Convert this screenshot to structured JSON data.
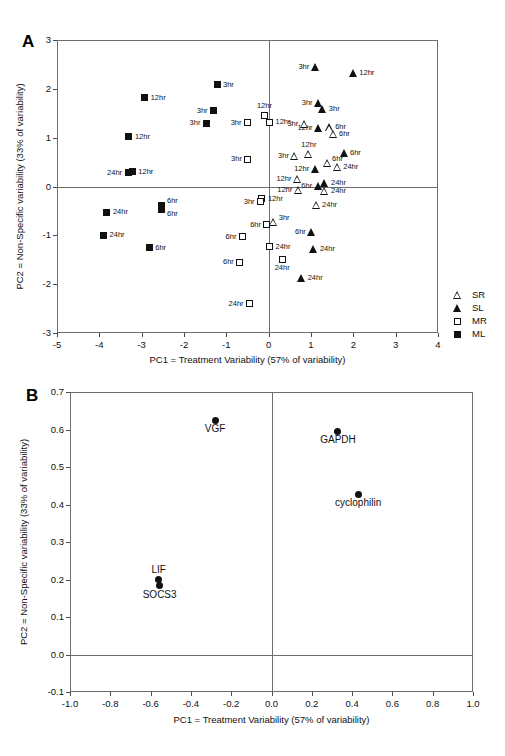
{
  "figure": {
    "panel_a_letter": "A",
    "panel_b_letter": "B"
  },
  "chart_data": [
    {
      "id": "panel_a",
      "type": "scatter",
      "title": "A",
      "xlabel": "PC1 = Treatment Variability (57% of variability)",
      "ylabel": "PC2 = Non-Specific variability (33% of variability)",
      "xlim": [
        -5,
        4
      ],
      "ylim": [
        -3,
        3
      ],
      "xticks": [
        "-5",
        "-4",
        "-3",
        "-2",
        "-1",
        "0",
        "1",
        "2",
        "3",
        "4"
      ],
      "yticks": [
        "3",
        "2",
        "1",
        "0",
        "-1",
        "-2",
        "-3"
      ],
      "grid": false,
      "zero_lines": true,
      "legend_position": "outside-bottom-right",
      "legend": [
        {
          "label": "SR",
          "marker": "open-triangle"
        },
        {
          "label": "SL",
          "marker": "filled-triangle"
        },
        {
          "label": "MR",
          "marker": "open-square"
        },
        {
          "label": "ML",
          "marker": "filled-square"
        }
      ],
      "series": [
        {
          "name": "ML",
          "marker": "filled-square",
          "points": [
            {
              "x": -1.22,
              "y": 2.08,
              "label": "3hr",
              "pos": "right"
            },
            {
              "x": -2.93,
              "y": 1.82,
              "label": "12hr",
              "pos": "right"
            },
            {
              "x": -1.3,
              "y": 1.55,
              "label": "3hr",
              "pos": "left"
            },
            {
              "x": -1.47,
              "y": 1.3,
              "label": "3hr",
              "pos": "left"
            },
            {
              "x": -3.3,
              "y": 1.02,
              "label": "12hr",
              "pos": "right"
            },
            {
              "x": -3.32,
              "y": 0.28,
              "label": "24hr",
              "pos": "left"
            },
            {
              "x": -3.22,
              "y": 0.3,
              "label": "12hr",
              "pos": "right"
            },
            {
              "x": -2.52,
              "y": -0.38,
              "label": "6hr",
              "pos": "above-right"
            },
            {
              "x": -2.52,
              "y": -0.47,
              "label": "6hr",
              "pos": "below-right"
            },
            {
              "x": -3.82,
              "y": -0.53,
              "label": "24hr",
              "pos": "right"
            },
            {
              "x": -3.9,
              "y": -1.0,
              "label": "24hr",
              "pos": "right"
            },
            {
              "x": -2.82,
              "y": -1.25,
              "label": "6hr",
              "pos": "right"
            }
          ]
        },
        {
          "name": "MR",
          "marker": "open-square",
          "points": [
            {
              "x": -0.1,
              "y": 1.46,
              "label": "12hr",
              "pos": "above"
            },
            {
              "x": -0.5,
              "y": 1.31,
              "label": "3hr",
              "pos": "left"
            },
            {
              "x": 0.02,
              "y": 1.32,
              "label": "12hr",
              "pos": "right"
            },
            {
              "x": -0.49,
              "y": 0.56,
              "label": "3hr",
              "pos": "left"
            },
            {
              "x": -0.16,
              "y": -0.25,
              "label": "12hr",
              "pos": "right"
            },
            {
              "x": -0.19,
              "y": -0.31,
              "label": "3hr",
              "pos": "left"
            },
            {
              "x": -0.04,
              "y": -0.78,
              "label": "6hr",
              "pos": "left"
            },
            {
              "x": -0.62,
              "y": -1.03,
              "label": "6hr",
              "pos": "left"
            },
            {
              "x": 0.02,
              "y": -1.23,
              "label": "24hr",
              "pos": "right"
            },
            {
              "x": -0.68,
              "y": -1.55,
              "label": "6hr",
              "pos": "left"
            },
            {
              "x": 0.32,
              "y": -1.49,
              "label": "24hr",
              "pos": "below"
            },
            {
              "x": -0.45,
              "y": -2.4,
              "label": "24hr",
              "pos": "left"
            }
          ]
        },
        {
          "name": "SL",
          "marker": "filled-triangle",
          "points": [
            {
              "x": 1.1,
              "y": 2.44,
              "label": "3hr",
              "pos": "left"
            },
            {
              "x": 2.0,
              "y": 2.33,
              "label": "12hr",
              "pos": "right"
            },
            {
              "x": 1.18,
              "y": 1.7,
              "label": "3hr",
              "pos": "left"
            },
            {
              "x": 1.28,
              "y": 1.58,
              "label": "3hr",
              "pos": "right"
            },
            {
              "x": 1.18,
              "y": 1.19,
              "label": "12hr",
              "pos": "left"
            },
            {
              "x": 1.78,
              "y": 0.68,
              "label": "6hr",
              "pos": "right"
            },
            {
              "x": 1.1,
              "y": 0.36,
              "label": "12hr",
              "pos": "left"
            },
            {
              "x": 1.33,
              "y": 0.07,
              "label": "24hr",
              "pos": "right"
            },
            {
              "x": 1.17,
              "y": 0.01,
              "label": "6hr",
              "pos": "left"
            },
            {
              "x": 1.02,
              "y": -0.94,
              "label": "6hr",
              "pos": "left"
            },
            {
              "x": 1.07,
              "y": -1.28,
              "label": "24hr",
              "pos": "right"
            },
            {
              "x": 0.78,
              "y": -1.88,
              "label": "24hr",
              "pos": "right"
            }
          ]
        },
        {
          "name": "SR",
          "marker": "open-triangle",
          "points": [
            {
              "x": 0.84,
              "y": 1.29,
              "label": "3hr",
              "pos": "left"
            },
            {
              "x": 1.43,
              "y": 1.21,
              "label": "6hr",
              "pos": "right"
            },
            {
              "x": 1.52,
              "y": 1.07,
              "label": "6hr",
              "pos": "right"
            },
            {
              "x": 0.62,
              "y": 0.63,
              "label": "3hr",
              "pos": "left"
            },
            {
              "x": 0.95,
              "y": 0.66,
              "label": "12hr",
              "pos": "above"
            },
            {
              "x": 1.38,
              "y": 0.48,
              "label": "6hr",
              "pos": "above-right"
            },
            {
              "x": 1.62,
              "y": 0.4,
              "label": "24hr",
              "pos": "right"
            },
            {
              "x": 0.68,
              "y": 0.16,
              "label": "12hr",
              "pos": "left"
            },
            {
              "x": 0.7,
              "y": -0.07,
              "label": "12hr",
              "pos": "left"
            },
            {
              "x": 1.33,
              "y": -0.09,
              "label": "24hr",
              "pos": "right"
            },
            {
              "x": 1.12,
              "y": -0.37,
              "label": "24hr",
              "pos": "right"
            },
            {
              "x": 0.12,
              "y": -0.72,
              "label": "3hr",
              "pos": "above-right"
            }
          ]
        }
      ]
    },
    {
      "id": "panel_b",
      "type": "scatter",
      "title": "B",
      "xlabel": "PC1 = Treatment Variability (57% of variability)",
      "ylabel": "PC2 = Non-Specific variability (33% of variability)",
      "xlim": [
        -1.0,
        1.0
      ],
      "ylim": [
        -0.1,
        0.7
      ],
      "xticks": [
        "-1.0",
        "-0.8",
        "-0.6",
        "-0.4",
        "-0.2",
        "0.0",
        "0.2",
        "0.4",
        "0.6",
        "0.8",
        "1.0"
      ],
      "yticks": [
        "0.7",
        "0.6",
        "0.5",
        "0.4",
        "0.3",
        "0.2",
        "0.1",
        "0.0",
        "-0.1"
      ],
      "grid": false,
      "zero_lines": true,
      "series": [
        {
          "name": "genes",
          "marker": "filled-circle",
          "points": [
            {
              "x": -0.28,
              "y": 0.625,
              "label": "VGF",
              "pos": "below"
            },
            {
              "x": 0.33,
              "y": 0.595,
              "label": "GAPDH",
              "pos": "below"
            },
            {
              "x": 0.43,
              "y": 0.428,
              "label": "cyclophilin",
              "pos": "below"
            },
            {
              "x": -0.56,
              "y": 0.201,
              "label": "LIF",
              "pos": "above"
            },
            {
              "x": -0.555,
              "y": 0.183,
              "label": "SOCS3",
              "pos": "below"
            }
          ]
        }
      ]
    }
  ]
}
